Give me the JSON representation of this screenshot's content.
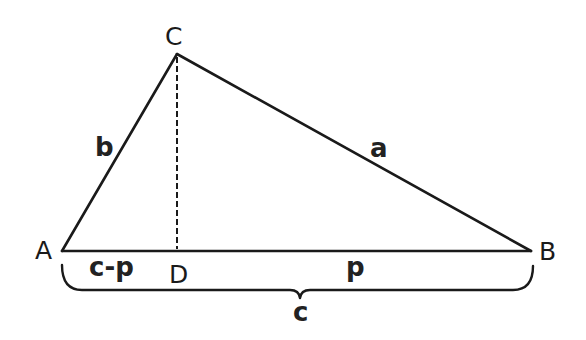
{
  "diagram": {
    "type": "triangle-with-altitude",
    "vertices": {
      "A": {
        "label": "A",
        "x": 62,
        "y": 251
      },
      "B": {
        "label": "B",
        "x": 531,
        "y": 251
      },
      "C": {
        "label": "C",
        "x": 177,
        "y": 54
      },
      "D": {
        "label": "D",
        "x": 177,
        "y": 251
      }
    },
    "sides": {
      "a": {
        "label": "a",
        "from": "C",
        "to": "B"
      },
      "b": {
        "label": "b",
        "from": "A",
        "to": "C"
      },
      "c": {
        "label": "c",
        "from": "A",
        "to": "B"
      }
    },
    "segments": {
      "AD": {
        "label": "c-p"
      },
      "DB": {
        "label": "p"
      }
    },
    "altitude": {
      "from": "C",
      "to": "D",
      "style": "dashed"
    },
    "brace": {
      "label": "c",
      "spans": "AB"
    },
    "colors": {
      "stroke": "#1a1a1a",
      "background": "#ffffff"
    }
  }
}
